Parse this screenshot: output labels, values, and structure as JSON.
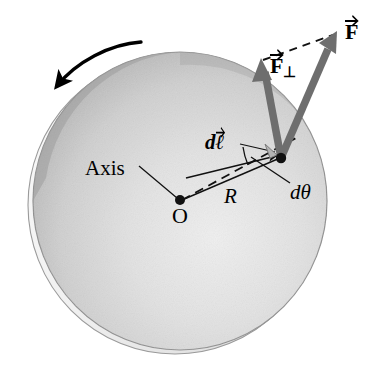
{
  "figure": {
    "background_color": "#ffffff"
  },
  "disk": {
    "name": "rotating-disk",
    "center_x": 180,
    "center_y": 201,
    "radius_x": 147,
    "radius_y": 149,
    "fill_light": "#e8e8e8",
    "fill_mid": "#c9c9c9",
    "fill_dark": "#a8a8a8",
    "rim_color": "#f2f2f2",
    "outline_color": "#8a8a8a"
  },
  "labels": {
    "axis": "Axis",
    "origin": "O",
    "radius": "R",
    "d_theta": "dθ",
    "d_l": "d",
    "d_l_symbol": "ℓ",
    "force": "F",
    "force_perp": "F",
    "force_perp_subscript": "⊥"
  },
  "points": {
    "origin": {
      "x": 180,
      "y": 201,
      "label": "O"
    },
    "application_point": {
      "x": 281,
      "y": 158,
      "label": ""
    }
  },
  "vectors": {
    "force": {
      "name": "force-vector",
      "label": "F",
      "tail_x": 281,
      "tail_y": 158,
      "tip_x": 337,
      "tip_y": 33,
      "color": "#6e6e6e",
      "width": 7
    },
    "force_perp": {
      "name": "force-perpendicular-vector",
      "label": "F⊥",
      "tail_x": 281,
      "tail_y": 158,
      "tip_x": 261,
      "tip_y": 61,
      "color": "#6e6e6e",
      "width": 7
    },
    "d_l": {
      "name": "displacement-vector",
      "label": "dℓ",
      "tail_x": 185,
      "tail_y": 177,
      "tip_x": 277,
      "tip_y": 156,
      "color": "#1a1a1a",
      "width": 1.4
    }
  },
  "lines": {
    "radius": {
      "name": "radius-line",
      "from_x": 180,
      "from_y": 201,
      "to_x": 281,
      "to_y": 158,
      "label": "R"
    },
    "radius_dashed": {
      "name": "radius-dashed-line",
      "from_x": 180,
      "from_y": 201,
      "to_x": 294,
      "to_y": 139
    },
    "force_dashed": {
      "name": "force-component-dashed-line",
      "from_x": 261,
      "from_y": 61,
      "to_x": 337,
      "to_y": 33
    },
    "axis_leader": {
      "name": "axis-leader-line",
      "from_x": 140,
      "from_y": 166,
      "to_x": 178,
      "to_y": 199
    },
    "dtheta_leader": {
      "name": "dtheta-leader-line",
      "from_x": 289,
      "from_y": 184,
      "to_x": 252,
      "to_y": 157
    },
    "dl_leader": {
      "name": "dl-leader-line",
      "from_x": 239,
      "from_y": 144,
      "to_x": 274,
      "to_y": 152
    }
  },
  "rotation_arrow": {
    "name": "rotation-direction-arrow",
    "direction": "counterclockwise",
    "color": "#000000",
    "start_x": 140,
    "start_y": 42,
    "end_x": 55,
    "end_y": 88
  },
  "angle_marker": {
    "name": "dtheta-angle-arc",
    "vertex_x": 180,
    "vertex_y": 201,
    "label": "dθ"
  },
  "right_angle_marker": {
    "name": "right-angle-marker",
    "x": 269,
    "y": 148
  }
}
